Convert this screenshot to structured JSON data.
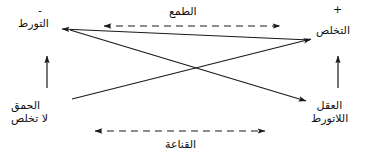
{
  "diagram": {
    "type": "semiotic-square",
    "background_color": "#ffffff",
    "line_color": "#1a1a1a",
    "text_color": "#111111",
    "corners": {
      "top_left": {
        "sign": "-",
        "lines": [
          "التورط"
        ]
      },
      "top_right": {
        "sign": "+",
        "lines": [
          "التخلص"
        ]
      },
      "bottom_left": {
        "lines": [
          "الحمق",
          "لا تخلص"
        ]
      },
      "bottom_right": {
        "lines": [
          "العقل",
          "اللاتورط"
        ]
      }
    },
    "relations": {
      "top_axis_label": "الطمع",
      "bottom_axis_label": "القناعة"
    },
    "connectors": [
      {
        "name": "top-dashed-double-arrow",
        "style": "dashed",
        "heads": "both"
      },
      {
        "name": "bottom-dashed-double-arrow",
        "style": "dashed",
        "heads": "both"
      },
      {
        "name": "left-vertical-arrow",
        "style": "solid",
        "heads": "up"
      },
      {
        "name": "right-vertical-arrow",
        "style": "solid",
        "heads": "up"
      },
      {
        "name": "diagonal-bottomleft-to-topright",
        "style": "solid",
        "heads": "end"
      },
      {
        "name": "diagonal-topleft-to-bottomright",
        "style": "solid",
        "heads": "end"
      }
    ]
  }
}
